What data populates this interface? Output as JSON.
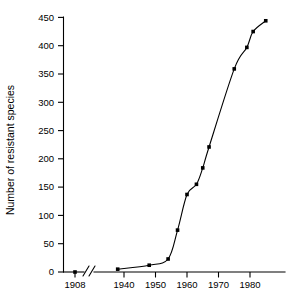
{
  "chart_data": {
    "type": "line",
    "title": "",
    "subtitle": "",
    "xlabel": "",
    "ylabel": "Number of resistant species",
    "xlim": [
      1935,
      1987
    ],
    "ylim": [
      0,
      450
    ],
    "grid": false,
    "legend": null,
    "axis_break": {
      "present": true,
      "between": [
        1908,
        1935
      ],
      "note": "double-slash break on x-axis between 1908 and the 1940s segment"
    },
    "x_ticks": [
      1908,
      1940,
      1950,
      1960,
      1970,
      1980
    ],
    "x_tick_labels": [
      "1908",
      "1940",
      "1950",
      "1960",
      "1970",
      "1980"
    ],
    "y_ticks": [
      0,
      50,
      100,
      150,
      200,
      250,
      300,
      350,
      400,
      450
    ],
    "y_tick_labels": [
      "0",
      "50",
      "100",
      "150",
      "200",
      "250",
      "300",
      "350",
      "400",
      "450"
    ],
    "series": [
      {
        "name": "Resistant species",
        "marker": "square",
        "marker_color": "#000000",
        "line_color": "#000000",
        "x": [
          1908,
          1938,
          1948,
          1954,
          1957,
          1960,
          1963,
          1965,
          1967,
          1975,
          1979,
          1981,
          1985
        ],
        "y": [
          0,
          5,
          12,
          23,
          74,
          137,
          155,
          184,
          221,
          359,
          397,
          425,
          444
        ],
        "points": [
          {
            "year": 1908,
            "value": 0
          },
          {
            "year": 1938,
            "value": 5
          },
          {
            "year": 1948,
            "value": 12
          },
          {
            "year": 1954,
            "value": 23
          },
          {
            "year": 1957,
            "value": 74
          },
          {
            "year": 1960,
            "value": 137
          },
          {
            "year": 1963,
            "value": 155
          },
          {
            "year": 1965,
            "value": 184
          },
          {
            "year": 1967,
            "value": 221
          },
          {
            "year": 1975,
            "value": 359
          },
          {
            "year": 1979,
            "value": 397
          },
          {
            "year": 1981,
            "value": 425
          },
          {
            "year": 1985,
            "value": 444
          }
        ]
      }
    ],
    "annotations": []
  },
  "figure": {
    "background_color": "#ffffff",
    "ink_color": "#000000"
  }
}
